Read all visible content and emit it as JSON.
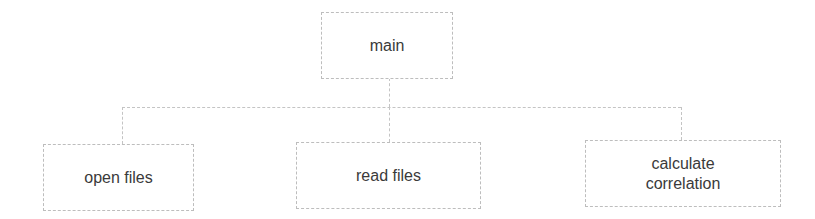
{
  "diagram": {
    "type": "hierarchy",
    "root": {
      "label": "main"
    },
    "children": [
      {
        "label": "open files"
      },
      {
        "label": "read files"
      },
      {
        "label": "calculate correlation",
        "lines": [
          "calculate",
          "correlation"
        ]
      }
    ],
    "colors": {
      "border": "#bdbdbd",
      "text": "#3a3a3a",
      "background": "#ffffff"
    }
  }
}
